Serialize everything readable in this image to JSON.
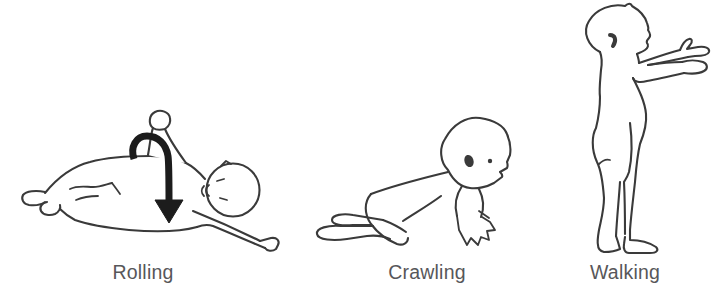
{
  "figure": {
    "stages": [
      {
        "id": "rolling",
        "label": "Rolling"
      },
      {
        "id": "crawling",
        "label": "Crawling"
      },
      {
        "id": "walking",
        "label": "Walking"
      }
    ],
    "colors": {
      "line": "#3a3a3a",
      "arrow": "#1c1c1c",
      "label_text": "#57575a",
      "background": "#ffffff"
    }
  }
}
